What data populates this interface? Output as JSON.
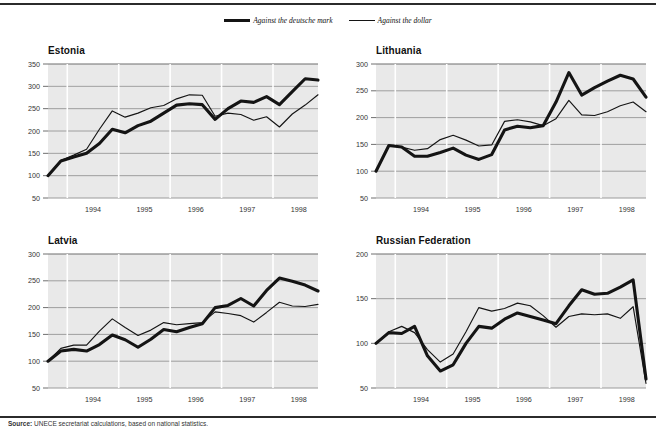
{
  "legend": {
    "entries": [
      {
        "label": "Against the deutsche mark",
        "style": "thick",
        "color": "#141414"
      },
      {
        "label": "Against the dollar",
        "style": "thin",
        "color": "#141414"
      }
    ]
  },
  "source": {
    "label": "Source:",
    "text": "UNECE secretariat calculations, based on national statistics."
  },
  "chart_data": [
    {
      "type": "line",
      "title": "Estonia",
      "xlabel": "",
      "ylabel": "",
      "ylim": [
        50,
        350
      ],
      "yticks": [
        50,
        100,
        150,
        200,
        250,
        300,
        350
      ],
      "xticks": [
        "1994",
        "1995",
        "1996",
        "1997",
        "1998"
      ],
      "xlim": [
        1993.5,
        1998.75
      ],
      "grid": true,
      "legend_position": "top-center-shared",
      "x": [
        1993.5,
        1993.75,
        1994.0,
        1994.25,
        1994.5,
        1994.75,
        1995.0,
        1995.25,
        1995.5,
        1995.75,
        1996.0,
        1996.25,
        1996.5,
        1996.75,
        1997.0,
        1997.25,
        1997.5,
        1997.75,
        1998.0,
        1998.25,
        1998.5,
        1998.75
      ],
      "series": [
        {
          "name": "Against the deutsche mark",
          "style": "thick",
          "values": [
            100,
            133,
            142,
            150,
            172,
            204,
            196,
            212,
            222,
            240,
            258,
            261,
            259,
            226,
            250,
            267,
            264,
            277,
            259,
            288,
            317,
            314
          ]
        },
        {
          "name": "Against the dollar",
          "style": "thin",
          "values": [
            100,
            134,
            146,
            159,
            204,
            245,
            231,
            240,
            252,
            257,
            272,
            281,
            280,
            233,
            240,
            237,
            224,
            232,
            209,
            238,
            258,
            281
          ]
        }
      ]
    },
    {
      "type": "line",
      "title": "Lithuania",
      "xlabel": "",
      "ylabel": "",
      "ylim": [
        50,
        300
      ],
      "yticks": [
        50,
        100,
        150,
        200,
        250,
        300
      ],
      "xticks": [
        "1994",
        "1995",
        "1996",
        "1997",
        "1998"
      ],
      "xlim": [
        1993.5,
        1998.75
      ],
      "grid": true,
      "legend_position": "top-center-shared",
      "x": [
        1993.5,
        1993.75,
        1994.0,
        1994.25,
        1994.5,
        1994.75,
        1995.0,
        1995.25,
        1995.5,
        1995.75,
        1996.0,
        1996.25,
        1996.5,
        1996.75,
        1997.0,
        1997.25,
        1997.5,
        1997.75,
        1998.0,
        1998.25,
        1998.5,
        1998.75
      ],
      "series": [
        {
          "name": "Against the deutsche mark",
          "style": "thick",
          "values": [
            100,
            148,
            145,
            128,
            128,
            135,
            143,
            130,
            122,
            131,
            177,
            184,
            181,
            185,
            229,
            284,
            242,
            256,
            268,
            279,
            272,
            238
          ]
        },
        {
          "name": "Against the dollar",
          "style": "thin",
          "values": [
            100,
            148,
            145,
            139,
            142,
            159,
            167,
            158,
            147,
            149,
            193,
            196,
            192,
            185,
            198,
            232,
            205,
            204,
            211,
            222,
            229,
            211
          ]
        }
      ]
    },
    {
      "type": "line",
      "title": "Latvia",
      "xlabel": "",
      "ylabel": "",
      "ylim": [
        50,
        300
      ],
      "yticks": [
        50,
        100,
        150,
        200,
        250,
        300
      ],
      "xticks": [
        "1994",
        "1995",
        "1996",
        "1997",
        "1998"
      ],
      "xlim": [
        1993.5,
        1998.75
      ],
      "grid": true,
      "legend_position": "top-center-shared",
      "x": [
        1993.5,
        1993.75,
        1994.0,
        1994.25,
        1994.5,
        1994.75,
        1995.0,
        1995.25,
        1995.5,
        1995.75,
        1996.0,
        1996.25,
        1996.5,
        1996.75,
        1997.0,
        1997.25,
        1997.5,
        1997.75,
        1998.0,
        1998.25,
        1998.5,
        1998.75
      ],
      "series": [
        {
          "name": "Against the deutsche mark",
          "style": "thick",
          "values": [
            100,
            119,
            122,
            119,
            131,
            149,
            140,
            126,
            141,
            159,
            155,
            163,
            170,
            200,
            204,
            217,
            203,
            232,
            255,
            249,
            242,
            231
          ]
        },
        {
          "name": "Against the dollar",
          "style": "thin",
          "values": [
            100,
            124,
            130,
            130,
            156,
            179,
            163,
            148,
            158,
            172,
            168,
            170,
            172,
            192,
            189,
            185,
            173,
            191,
            210,
            203,
            202,
            206
          ]
        }
      ]
    },
    {
      "type": "line",
      "title": "Russian Federation",
      "xlabel": "",
      "ylabel": "",
      "ylim": [
        50,
        200
      ],
      "yticks": [
        50,
        100,
        150,
        200
      ],
      "xticks": [
        "1994",
        "1995",
        "1996",
        "1997",
        "1998"
      ],
      "xlim": [
        1993.5,
        1998.75
      ],
      "grid": true,
      "legend_position": "top-center-shared",
      "x": [
        1993.5,
        1993.75,
        1994.0,
        1994.25,
        1994.5,
        1994.75,
        1995.0,
        1995.25,
        1995.5,
        1995.75,
        1996.0,
        1996.25,
        1996.5,
        1996.75,
        1997.0,
        1997.25,
        1997.5,
        1997.75,
        1998.0,
        1998.25,
        1998.5,
        1998.75
      ],
      "series": [
        {
          "name": "Against the deutsche mark",
          "style": "thick",
          "values": [
            100,
            112,
            111,
            119,
            86,
            69,
            76,
            100,
            119,
            117,
            127,
            134,
            130,
            126,
            122,
            142,
            160,
            155,
            156,
            163,
            171,
            60
          ]
        },
        {
          "name": "Against the dollar",
          "style": "thin",
          "values": [
            100,
            113,
            119,
            112,
            93,
            79,
            88,
            113,
            140,
            136,
            139,
            145,
            142,
            131,
            118,
            130,
            133,
            132,
            133,
            128,
            141,
            55
          ]
        }
      ]
    }
  ]
}
